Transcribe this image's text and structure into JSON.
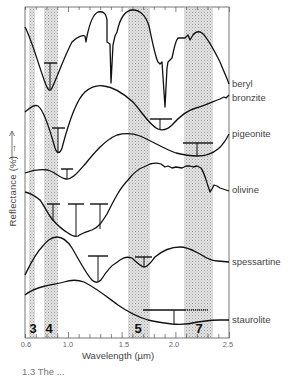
{
  "chart_data": {
    "type": "line",
    "title": "",
    "xlabel": "Wavelength (µm)",
    "ylabel": "Reflectance (%) →",
    "xlim": [
      0.6,
      2.5
    ],
    "x_ticks": [
      "0.6",
      "1.0",
      "1.5",
      "2.0",
      "2.5"
    ],
    "x_tick_values": [
      0.6,
      1.0,
      1.5,
      2.0,
      2.5
    ],
    "grid": false,
    "legend": "inline labels at right edge",
    "note": "Curves are vertically offset; y is relative reflectance (no y tick values shown). Values below are approximate pixel-traced (x in µm, y in relative units 0=bottom,100=top of frame).",
    "shaded_bands": [
      {
        "label": "3",
        "x_range": [
          0.63,
          0.69
        ]
      },
      {
        "label": "4",
        "x_range": [
          0.76,
          0.89
        ]
      },
      {
        "label": "5",
        "x_range": [
          1.55,
          1.75
        ]
      },
      {
        "label": "7",
        "x_range": [
          2.08,
          2.35
        ]
      }
    ],
    "series": [
      {
        "name": "beryl",
        "x": [
          0.6,
          0.66,
          0.72,
          0.78,
          0.83,
          0.9,
          0.98,
          1.05,
          1.14,
          1.25,
          1.32,
          1.35,
          1.37,
          1.4,
          1.42,
          1.44,
          1.5,
          1.6,
          1.72,
          1.8,
          1.86,
          1.88,
          1.92,
          1.98,
          2.08,
          2.17,
          2.22,
          2.3,
          2.42,
          2.5
        ],
        "y": [
          94,
          86,
          78,
          72,
          75,
          83,
          88,
          91,
          96,
          98,
          97,
          88,
          74,
          86,
          91,
          94,
          99,
          96,
          91,
          79,
          69,
          66,
          80,
          87,
          90,
          90,
          92,
          89,
          82,
          77
        ]
      },
      {
        "name": "bronzite",
        "x": [
          0.6,
          0.67,
          0.72,
          0.78,
          0.83,
          0.88,
          0.95,
          1.05,
          1.15,
          1.25,
          1.4,
          1.55,
          1.7,
          1.83,
          1.9,
          1.96,
          2.05,
          2.18,
          2.32,
          2.5
        ],
        "y": [
          69,
          71,
          68,
          60,
          55,
          59,
          67,
          74,
          76,
          75,
          73,
          68,
          62,
          58,
          57,
          59,
          63,
          65,
          67,
          70
        ],
        "absorption_center": [
          0.9,
          1.87
        ]
      },
      {
        "name": "pigeonite",
        "x": [
          0.6,
          0.7,
          0.8,
          0.9,
          0.98,
          1.05,
          1.15,
          1.3,
          1.45,
          1.6,
          1.8,
          1.95,
          2.1,
          2.2,
          2.3,
          2.4,
          2.5
        ],
        "y": [
          50,
          51,
          49,
          47,
          50,
          53,
          58,
          61,
          62,
          61,
          57,
          53,
          50,
          49,
          51,
          55,
          61
        ],
        "absorption_center": [
          0.92,
          2.2
        ]
      },
      {
        "name": "olivine",
        "x": [
          0.6,
          0.72,
          0.82,
          0.9,
          1.0,
          1.1,
          1.2,
          1.32,
          1.42,
          1.55,
          1.65,
          1.76,
          1.9,
          2.08,
          2.2,
          2.28,
          2.35,
          2.42,
          2.5
        ],
        "y": [
          44,
          43,
          39,
          34,
          30,
          31,
          35,
          44,
          51,
          53,
          52,
          52,
          51,
          52,
          45,
          47,
          45,
          44,
          45
        ],
        "absorption_center": [
          0.85,
          1.05,
          1.25
        ]
      },
      {
        "name": "spessartine",
        "x": [
          0.6,
          0.67,
          0.75,
          0.82,
          0.9,
          1.0,
          1.1,
          1.2,
          1.28,
          1.36,
          1.45,
          1.55,
          1.64,
          1.7,
          1.78,
          1.88,
          2.0,
          2.1,
          2.2,
          2.3,
          2.5
        ],
        "y": [
          19,
          25,
          30,
          31,
          29,
          22,
          15,
          12,
          16,
          19,
          21,
          20,
          18,
          18,
          22,
          23,
          24,
          22,
          21,
          20,
          19
        ]
      },
      {
        "name": "staurolite",
        "x": [
          0.6,
          0.7,
          0.8,
          0.9,
          1.0,
          1.1,
          1.2,
          1.35,
          1.5,
          1.6,
          1.7,
          1.8,
          1.95,
          2.1,
          2.25,
          2.5
        ],
        "y": [
          13,
          15,
          16,
          17,
          18,
          18,
          17,
          13,
          8,
          6,
          4,
          3,
          3,
          3,
          4,
          4
        ],
        "absorption_center": [
          2.0
        ]
      }
    ]
  },
  "axis": {
    "ylabel": "Reflectance (%) →",
    "xlabel": "Wavelength (µm)",
    "ticks": [
      {
        "label": "0.6",
        "x": 26
      },
      {
        "label": "1.0",
        "x": 68
      },
      {
        "label": "1.5",
        "x": 124
      },
      {
        "label": "2.0",
        "x": 174
      },
      {
        "label": "2.5",
        "x": 228
      }
    ]
  },
  "bands": [
    {
      "label": "3",
      "x1": 29,
      "x2": 35,
      "lx": 33
    },
    {
      "label": "4",
      "x1": 44,
      "x2": 58,
      "lx": 49
    },
    {
      "label": "5",
      "x1": 128,
      "x2": 150,
      "lx": 138
    },
    {
      "label": "7",
      "x1": 184,
      "x2": 213,
      "lx": 199
    }
  ],
  "minerals": [
    {
      "label": "beryl",
      "y": 78
    },
    {
      "label": "bronzite",
      "y": 92
    },
    {
      "label": "pigeonite",
      "y": 128
    },
    {
      "label": "olivine",
      "y": 184
    },
    {
      "label": "spessartine",
      "y": 256
    },
    {
      "label": "staurolite",
      "y": 314
    }
  ],
  "caption": "1.3  The ..."
}
